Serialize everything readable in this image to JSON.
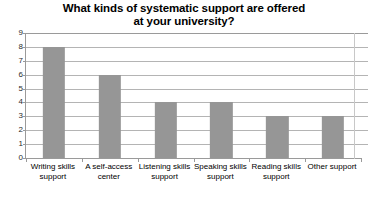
{
  "chart_data": {
    "type": "bar",
    "title": "What kinds of systematic support are offered at your university?",
    "title_lines": [
      "What kinds of systematic support are offered",
      "at your university?"
    ],
    "categories": [
      "Writing skills support",
      "A self-access center",
      "Listening skills support",
      "Speaking skills support",
      "Reading skills support",
      "Other support"
    ],
    "category_label_lines": [
      [
        "Writing skills",
        "support"
      ],
      [
        "A self-access",
        "center"
      ],
      [
        "Listening skills",
        "support"
      ],
      [
        "Speaking skills",
        "support"
      ],
      [
        "Reading skills",
        "support"
      ],
      [
        "Other support"
      ]
    ],
    "values": [
      8,
      6,
      4,
      4,
      3,
      3
    ],
    "xlabel": "",
    "ylabel": "",
    "ylim": [
      0,
      9
    ],
    "y_ticks": [
      0,
      1,
      2,
      3,
      4,
      5,
      6,
      7,
      8,
      9
    ],
    "y_tick_labels": [
      "0",
      "1",
      "2",
      "3",
      "4",
      "5",
      "6",
      "7",
      "8",
      "9"
    ],
    "grid": true,
    "grid_axis": "y",
    "legend": false,
    "legend_position": "none",
    "bar_color": "#969696",
    "grid_color": "#b4b4b4",
    "axis_color": "#9a9a9a",
    "background_color": "#ffffff",
    "text_color": "#000000"
  }
}
